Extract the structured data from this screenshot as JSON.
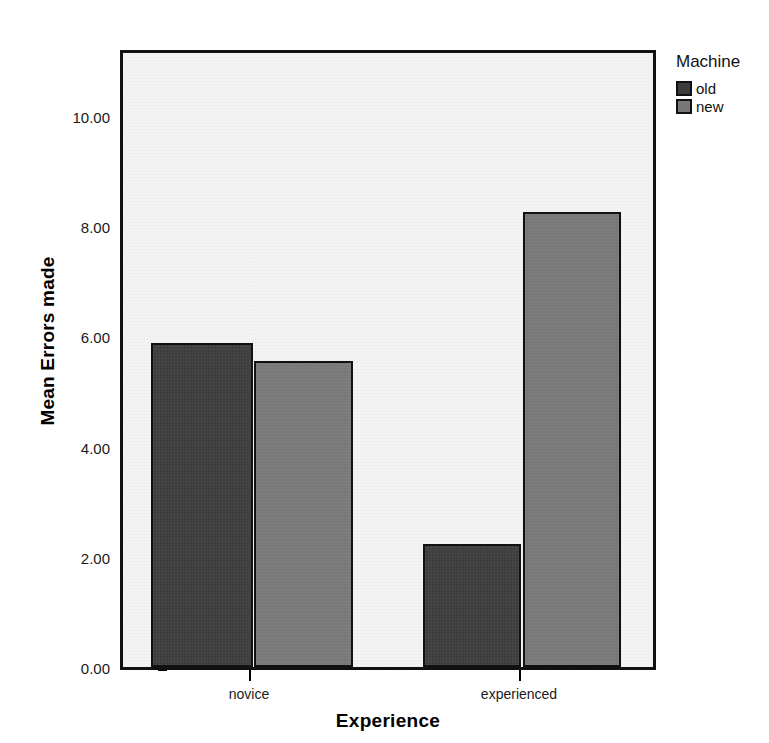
{
  "chart_data": {
    "type": "bar",
    "title": "",
    "xlabel": "Experience",
    "ylabel": "Mean Errors made",
    "categories": [
      "novice",
      "experienced"
    ],
    "series": [
      {
        "name": "old",
        "color": "#3d3d3d",
        "values": [
          5.88,
          2.23
        ]
      },
      {
        "name": "new",
        "color": "#787878",
        "values": [
          5.55,
          8.26
        ]
      }
    ],
    "ylim": [
      0,
      11.2
    ],
    "yticks": [
      0,
      2,
      4,
      6,
      8,
      10
    ],
    "ytick_labels": [
      "0.00",
      "2.00",
      "4.00",
      "6.00",
      "8.00",
      "10.00"
    ],
    "grid": false,
    "legend": {
      "title": "Machine",
      "position": "right-top",
      "entries": [
        {
          "label": "old",
          "color": "#3d3d3d"
        },
        {
          "label": "new",
          "color": "#787878"
        }
      ]
    },
    "plot_background": "#f4f4f4",
    "axis_color": "#111111"
  }
}
